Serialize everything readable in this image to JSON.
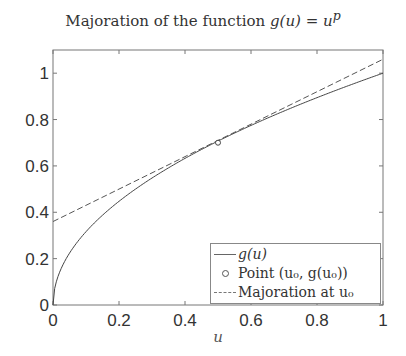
{
  "chart_data": {
    "type": "line",
    "xlabel": "u",
    "ylabel": "",
    "xlim": [
      0,
      1
    ],
    "ylim": [
      0,
      1.1
    ],
    "xticks": [
      "0",
      "0.2",
      "0.4",
      "0.6",
      "0.8",
      "1"
    ],
    "yticks": [
      "0",
      "0.2",
      "0.4",
      "0.6",
      "0.8",
      "1"
    ],
    "grid": false,
    "legend_position": "lower right",
    "series": [
      {
        "name": "g(u)",
        "style": "solid",
        "function": "u^p",
        "p": 0.5,
        "x": [
          0,
          0.05,
          0.1,
          0.2,
          0.3,
          0.4,
          0.5,
          0.6,
          0.7,
          0.8,
          0.9,
          1.0
        ],
        "y": [
          0,
          0.224,
          0.316,
          0.447,
          0.548,
          0.632,
          0.707,
          0.775,
          0.837,
          0.894,
          0.949,
          1.0
        ]
      },
      {
        "name": "Point (u0, g(u0))",
        "style": "marker-circle",
        "x": [
          0.5
        ],
        "y": [
          0.7
        ]
      },
      {
        "name": "Majoration at u0",
        "style": "dashed",
        "x": [
          0,
          1
        ],
        "y": [
          0.36,
          1.06
        ]
      }
    ]
  },
  "title": {
    "prefix": "Majoration of the function ",
    "math": "g(u) = u",
    "sup": "p"
  },
  "legend": {
    "items": [
      {
        "label": "g(u)"
      },
      {
        "label": "Point (u₀, g(u₀))"
      },
      {
        "label": "Majoration at u₀"
      }
    ]
  },
  "axes": {
    "xlabel": "u",
    "xticks": [
      "0",
      "0.2",
      "0.4",
      "0.6",
      "0.8",
      "1"
    ],
    "yticks": [
      "0",
      "0.2",
      "0.4",
      "0.6",
      "0.8",
      "1"
    ]
  }
}
